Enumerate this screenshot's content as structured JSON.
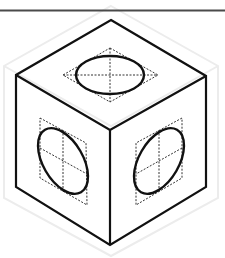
{
  "figure": {
    "type": "isometric-cube-with-inscribed-ellipses",
    "width": 225,
    "height": 258,
    "colors": {
      "background": "#ffffff",
      "outline": "#111111",
      "rule": "#4a4a4a",
      "construction": "#333333",
      "ghost": "#ececec"
    },
    "top_rule": {
      "x1": 0,
      "y1": 10.5,
      "x2": 225,
      "y2": 10.5
    },
    "cube": {
      "top": [
        111,
        20
      ],
      "left": [
        16,
        75
      ],
      "right": [
        206,
        76
      ],
      "center": [
        110,
        130
      ],
      "bottom_left": [
        16,
        187
      ],
      "bottom_right": [
        206,
        187
      ],
      "bottom": [
        110,
        245
      ]
    },
    "faces": [
      {
        "name": "top",
        "rhombus": [
          [
            110,
            48
          ],
          [
            158,
            75
          ],
          [
            110,
            102
          ],
          [
            63,
            75
          ]
        ],
        "axes": [
          [
            [
              110,
              48
            ],
            [
              110,
              102
            ]
          ],
          [
            [
              63,
              75
            ],
            [
              158,
              75
            ]
          ]
        ],
        "ellipse": {
          "cx": 110,
          "cy": 75,
          "rx": 34,
          "ry": 19,
          "rotate": 0
        }
      },
      {
        "name": "left",
        "rhombus": [
          [
            40,
            118
          ],
          [
            86,
            143
          ],
          [
            87,
            205
          ],
          [
            40,
            178
          ]
        ],
        "axes": [
          [
            [
              40,
              148
            ],
            [
              87,
              174
            ]
          ],
          [
            [
              63,
              130
            ],
            [
              63,
              192
            ]
          ]
        ],
        "ellipse": {
          "cx": 63,
          "cy": 161,
          "rx": 36,
          "ry": 20,
          "rotate": 60
        }
      },
      {
        "name": "right",
        "rhombus": [
          [
            182,
            118
          ],
          [
            136,
            143
          ],
          [
            136,
            205
          ],
          [
            182,
            178
          ]
        ],
        "axes": [
          [
            [
              182,
              148
            ],
            [
              136,
              174
            ]
          ],
          [
            [
              159,
              130
            ],
            [
              159,
              192
            ]
          ]
        ],
        "ellipse": {
          "cx": 159,
          "cy": 161,
          "rx": 36,
          "ry": 20,
          "rotate": -60
        }
      }
    ]
  }
}
